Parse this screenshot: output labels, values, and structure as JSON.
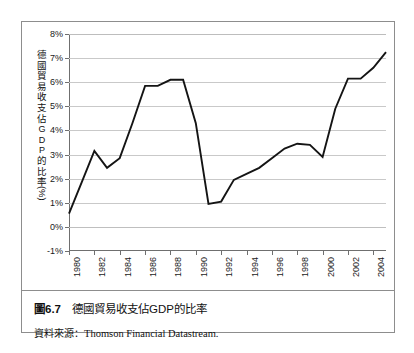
{
  "figure": {
    "caption_number": "圖6.7",
    "caption_text": "德國貿易收支佔GDP的比率",
    "source_label": "資料來源：",
    "source_text": "Thomson Financial Datastream."
  },
  "chart_data": {
    "type": "line",
    "title": "德國貿易收支佔GDP的比率",
    "xlabel": "",
    "ylabel": "德國貿易收支佔GDP的比率（%）",
    "ylabel_chars": [
      "德",
      "國",
      "貿",
      "易",
      "收",
      "支",
      "佔",
      "G",
      "D",
      "P",
      "的",
      "比",
      "率",
      "（%）"
    ],
    "ylim": [
      -1,
      8
    ],
    "xlim": [
      1980,
      2005
    ],
    "ytick_labels": [
      "8%",
      "7%",
      "6%",
      "5%",
      "4%",
      "3%",
      "2%",
      "1%",
      "0%",
      "-1%"
    ],
    "ytick_values": [
      8,
      7,
      6,
      5,
      4,
      3,
      2,
      1,
      0,
      -1
    ],
    "xtick_labels": [
      "1980",
      "1982",
      "1984",
      "1986",
      "1988",
      "1990",
      "1992",
      "1994",
      "1996",
      "1998",
      "2000",
      "2002",
      "2004"
    ],
    "xtick_values": [
      1980,
      1982,
      1984,
      1986,
      1988,
      1990,
      1992,
      1994,
      1996,
      1998,
      2000,
      2002,
      2004
    ],
    "grid": true,
    "legend": "none",
    "line_color": "#141414",
    "x": [
      1980,
      1981,
      1982,
      1983,
      1984,
      1985,
      1986,
      1987,
      1988,
      1989,
      1990,
      1991,
      1992,
      1993,
      1994,
      1995,
      1996,
      1997,
      1998,
      1999,
      2000,
      2001,
      2002,
      2003,
      2004,
      2005
    ],
    "values": [
      0.55,
      1.85,
      3.15,
      2.45,
      2.85,
      4.3,
      5.85,
      5.85,
      6.1,
      6.1,
      4.3,
      0.95,
      1.05,
      1.95,
      2.2,
      2.45,
      2.85,
      3.25,
      3.45,
      3.4,
      2.9,
      4.9,
      6.15,
      6.15,
      6.6,
      7.25
    ],
    "series": [
      {
        "name": "德國貿易收支佔GDP的比率",
        "values": [
          0.55,
          1.85,
          3.15,
          2.45,
          2.85,
          4.3,
          5.85,
          5.85,
          6.1,
          6.1,
          4.3,
          0.95,
          1.05,
          1.95,
          2.2,
          2.45,
          2.85,
          3.25,
          3.45,
          3.4,
          2.9,
          4.9,
          6.15,
          6.15,
          6.6,
          7.25
        ]
      }
    ]
  }
}
